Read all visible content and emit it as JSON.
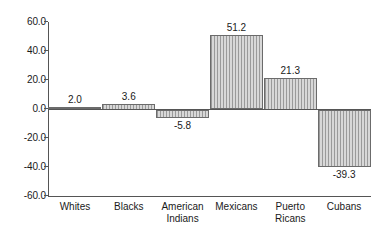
{
  "chart_data": {
    "type": "bar",
    "title": "",
    "subtitle": "",
    "xlabel": "",
    "ylabel": "",
    "categories": [
      "Whites",
      "Blacks",
      "American Indians",
      "Mexicans",
      "Puerto Ricans",
      "Cubans"
    ],
    "values": [
      2.0,
      3.6,
      -5.8,
      51.2,
      21.3,
      -39.3
    ],
    "value_labels": [
      "2.0",
      "3.6",
      "-5.8",
      "51.2",
      "21.3",
      "-39.3"
    ],
    "ylim": [
      -60.0,
      60.0
    ],
    "ytick_values": [
      60.0,
      40.0,
      20.0,
      0.0,
      -20.0,
      -40.0,
      -60.0
    ],
    "ytick_labels": [
      "60.0",
      "40.0",
      "20.0",
      "0.0",
      "-20.0",
      "-40.0",
      "-60.0"
    ],
    "grid": false,
    "legend": false,
    "legend_position": "none",
    "bar_fill": "vertical-hatch",
    "bar_fill_color": "#cfcfcf",
    "bar_line_color": "#9a9a9a",
    "bar_edge_color": "#6b6b6b",
    "axis_color": "#555555",
    "background_color": "#ffffff",
    "text_color": "#1a1a1a"
  },
  "categories_wrapped": [
    [
      "Whites"
    ],
    [
      "Blacks"
    ],
    [
      "American",
      "Indians"
    ],
    [
      "Mexicans"
    ],
    [
      "Puerto",
      "Ricans"
    ],
    [
      "Cubans"
    ]
  ]
}
